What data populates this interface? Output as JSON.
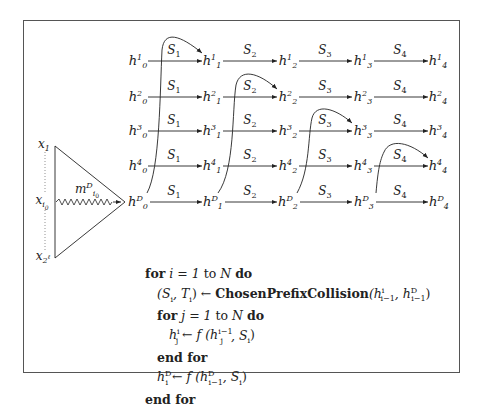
{
  "figure": {
    "rows": [
      {
        "id": "1",
        "label_sup": "1"
      },
      {
        "id": "2",
        "label_sup": "2"
      },
      {
        "id": "3",
        "label_sup": "3"
      },
      {
        "id": "4",
        "label_sup": "4"
      },
      {
        "id": "D",
        "label_sup": "D"
      }
    ],
    "columns": [
      "0",
      "1",
      "2",
      "3",
      "4"
    ],
    "node_symbol": "h",
    "edge_labels": [
      "S",
      "S",
      "S",
      "S"
    ],
    "edge_label_subs": [
      "1",
      "2",
      "3",
      "4"
    ],
    "inputs": {
      "top": {
        "base": "x",
        "sub": "1"
      },
      "middle": {
        "base": "x",
        "sub": "i",
        "subsub": "0"
      },
      "bottom": {
        "base": "x",
        "sub": "2",
        "subsup": "ℓ"
      }
    },
    "message": {
      "base": "m",
      "sup": "D",
      "sub": "i",
      "subsub": "0"
    }
  },
  "algorithm": {
    "line1": {
      "kw1": "for",
      "expr": "i = 1",
      "kw2": "to",
      "var": "N",
      "kw3": "do"
    },
    "line2": {
      "lhs": "(S",
      "lhs_sub1": "i",
      "lhs_mid": ", T",
      "lhs_sub2": "i",
      "lhs_end": ")",
      "arrow": "←",
      "func": "ChosenPrefixCollision",
      "args_open": "(h",
      "arg1_sup": "i",
      "arg1_sub": "i−1",
      "args_sep": ", h",
      "arg2_sup": "D",
      "arg2_sub": "i−1",
      "args_close": ")"
    },
    "line3": {
      "kw1": "for",
      "expr": "j = 1",
      "kw2": "to",
      "var": "N",
      "kw3": "do"
    },
    "line4": {
      "lhs": "h",
      "lhs_sup": "i",
      "lhs_sub": "j",
      "arrow": "←",
      "func": "f",
      "open": "(h",
      "arg_sup": "i−1",
      "arg_sub": "j",
      "rest": ", S",
      "rest_sub": "i",
      "close": ")"
    },
    "line5": {
      "kw": "end for"
    },
    "line6": {
      "lhs": "h",
      "lhs_sup": "D",
      "lhs_sub": "i",
      "arrow": "←",
      "func": "f",
      "open": "(h",
      "arg_sup": "D",
      "arg_sub": "i−1",
      "rest": ", S",
      "rest_sub": "i",
      "close": ")"
    },
    "line7": {
      "kw": "end for"
    }
  }
}
